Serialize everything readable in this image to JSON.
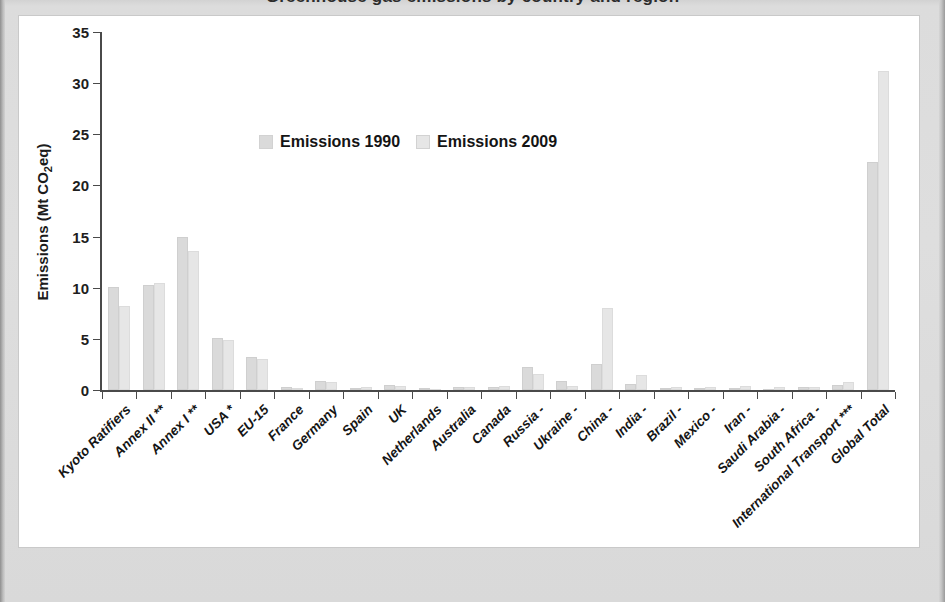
{
  "page": {
    "title_cut_off": "Greenhouse gas emissions by country and region",
    "background_color": "#d8d8d8",
    "panel_color": "#ffffff"
  },
  "chart_data": {
    "type": "bar",
    "title": "Greenhouse gas emissions by country and region",
    "xlabel": "",
    "ylabel": "Emissions (Mt CO2eq)",
    "ylabel_html": "Emissions (Mt CO₂eq)",
    "ylim": [
      0,
      35
    ],
    "yticks": [
      0,
      5,
      10,
      15,
      20,
      25,
      30,
      35
    ],
    "grid": false,
    "legend_position": "inside-top-center",
    "categories": [
      "Kyoto Ratifiers",
      "Annex II **",
      "Annex I **",
      "USA *",
      "EU-15",
      "France",
      "Germany",
      "Spain",
      "UK",
      "Netherlands",
      "Australia",
      "Canada",
      "Russia -",
      "Ukraine -",
      "China -",
      "India -",
      "Brazil -",
      "Mexico -",
      "Iran -",
      "Saudi Arabia -",
      "South Africa -",
      "International Transport ***",
      "Global Total"
    ],
    "series": [
      {
        "name": "Emissions 1990",
        "color": "#dadada",
        "values": [
          10.1,
          10.3,
          15.0,
          5.1,
          3.2,
          0.25,
          0.85,
          0.22,
          0.45,
          0.15,
          0.25,
          0.3,
          2.2,
          0.9,
          2.5,
          0.6,
          0.2,
          0.2,
          0.15,
          0.1,
          0.25,
          0.45,
          22.3
        ]
      },
      {
        "name": "Emissions 2009",
        "color": "#e6e6e6",
        "values": [
          8.2,
          10.45,
          13.6,
          4.9,
          3.0,
          0.22,
          0.75,
          0.26,
          0.4,
          0.14,
          0.3,
          0.35,
          1.6,
          0.4,
          8.0,
          1.5,
          0.3,
          0.3,
          0.35,
          0.25,
          0.28,
          0.75,
          31.2
        ]
      }
    ]
  },
  "legend": {
    "items": [
      {
        "label": "Emissions 1990",
        "color": "#dadada"
      },
      {
        "label": "Emissions 2009",
        "color": "#e6e6e6"
      }
    ]
  },
  "axis": {
    "y_title_main": "Emissions (Mt CO",
    "y_title_sub": "2",
    "y_title_tail": "eq)"
  }
}
